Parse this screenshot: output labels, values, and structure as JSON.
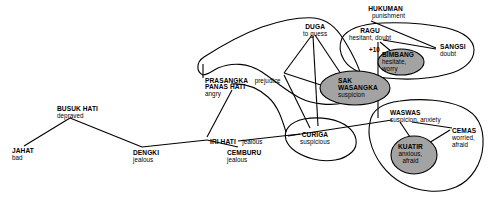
{
  "diagram": {
    "type": "semantic-network",
    "title": "",
    "colors": {
      "background": "#ffffff",
      "stroke": "#000000",
      "shaded_fill": "#a3a3a3",
      "text": "#000000"
    },
    "nodes": [
      {
        "id": "jahat",
        "term": "JAHAT",
        "gloss": "bad",
        "layout": "stacked",
        "shaded": false,
        "x": 12,
        "y": 148
      },
      {
        "id": "busuk_hati",
        "term": "BUSUK HATI",
        "gloss": "depraved",
        "layout": "stacked",
        "shaded": false,
        "x": 57,
        "y": 106
      },
      {
        "id": "dengki",
        "term": "DENGKI",
        "gloss": "jealous",
        "layout": "stacked",
        "shaded": false,
        "x": 133,
        "y": 150
      },
      {
        "id": "iri_hati",
        "term": "IRI HATI",
        "gloss": "jealous",
        "layout": "inline",
        "shaded": false,
        "x": 210,
        "y": 131
      },
      {
        "id": "cemburu",
        "term": "CEMBURU",
        "gloss": "jealous",
        "layout": "stacked",
        "shaded": false,
        "x": 227,
        "y": 150
      },
      {
        "id": "prasangka",
        "term": "PRASANGKA",
        "gloss": "prejudice",
        "layout": "inline",
        "shaded": false,
        "x": 205,
        "y": 70
      },
      {
        "id": "panas_hati",
        "term": "PANAS HATI",
        "gloss": "angry",
        "layout": "stacked",
        "shaded": false,
        "x": 205,
        "y": 84
      },
      {
        "id": "duga",
        "term": "DUGA",
        "gloss": "to guess",
        "layout": "stacked",
        "shaded": false,
        "x": 303,
        "y": 24
      },
      {
        "id": "curiga",
        "term": "CURIGA",
        "gloss": "suspicious",
        "layout": "stacked",
        "shaded": false,
        "x": 300,
        "y": 132
      },
      {
        "id": "sak_wasangka",
        "term": "SAK\nWASANGKA",
        "gloss": "suspicion",
        "layout": "stacked",
        "shaded": true,
        "x": 338,
        "y": 78
      },
      {
        "id": "hukuman",
        "term": "HUKUMAN",
        "gloss": "punishment",
        "layout": "stacked",
        "shaded": false,
        "x": 366,
        "y": 6
      },
      {
        "id": "ragu",
        "term": "RAGU",
        "gloss": "hesitant, doubt",
        "layout": "stacked",
        "shaded": false,
        "x": 349,
        "y": 28
      },
      {
        "id": "bimbang",
        "term": "BIMBANG",
        "gloss": "hesitate,\nworry",
        "layout": "stacked",
        "shaded": true,
        "x": 382,
        "y": 52
      },
      {
        "id": "sangsi",
        "term": "SANGSI",
        "gloss": "doubt",
        "layout": "stacked",
        "shaded": false,
        "x": 440,
        "y": 44
      },
      {
        "id": "waswas",
        "term": "WASWAS",
        "gloss": "suspicion, anxiety",
        "layout": "stacked",
        "shaded": false,
        "x": 390,
        "y": 110
      },
      {
        "id": "kuatir",
        "term": "KUATIR",
        "gloss": "anxious,\nafraid",
        "layout": "stacked",
        "shaded": true,
        "x": 398,
        "y": 144
      },
      {
        "id": "cemas",
        "term": "CEMAS",
        "gloss": "worried,\nafraid",
        "layout": "stacked",
        "shaded": false,
        "x": 452,
        "y": 128
      }
    ],
    "annotations": [
      {
        "id": "plus-ten",
        "text": "+10",
        "x": 369,
        "y": 46
      }
    ],
    "shaded_ellipses": [
      {
        "id": "sak-wasangka-ellipse",
        "cx": 355,
        "cy": 88,
        "rx": 35,
        "ry": 17
      },
      {
        "id": "bimbang-ellipse",
        "cx": 401,
        "cy": 62,
        "rx": 23,
        "ry": 13
      },
      {
        "id": "kuatir-ellipse",
        "cx": 414,
        "cy": 155,
        "rx": 23,
        "ry": 19
      }
    ],
    "edges": [
      {
        "from": "jahat",
        "to": "busuk_hati"
      },
      {
        "from": "busuk_hati",
        "to": "dengki"
      },
      {
        "from": "dengki",
        "to": "iri_hati"
      },
      {
        "from": "iri_hati",
        "to": "cemburu"
      },
      {
        "from": "iri_hati",
        "to": "panas_hati"
      },
      {
        "from": "cemburu",
        "to": "curiga"
      },
      {
        "from": "curiga",
        "to": "waswas"
      },
      {
        "from": "prasangka",
        "to": "duga"
      },
      {
        "from": "prasangka",
        "to": "sak_wasangka"
      },
      {
        "from": "prasangka",
        "to": "curiga"
      },
      {
        "from": "duga",
        "to": "sak_wasangka"
      },
      {
        "from": "duga",
        "to": "curiga"
      },
      {
        "from": "hukuman",
        "to": "sangsi"
      },
      {
        "from": "ragu",
        "to": "sangsi"
      },
      {
        "from": "ragu",
        "to": "bimbang"
      },
      {
        "from": "sak_wasangka",
        "to": "ragu"
      },
      {
        "from": "waswas",
        "to": "kuatir"
      },
      {
        "from": "waswas",
        "to": "cemas"
      },
      {
        "from": "kuatir",
        "to": "cemas"
      }
    ],
    "groups": [
      {
        "id": "prasangka-duga-group",
        "label": "prejudice-guess cluster"
      },
      {
        "id": "ragu-sangsi-group",
        "label": "doubt cluster"
      },
      {
        "id": "waswas-cemas-group",
        "label": "anxiety cluster"
      },
      {
        "id": "curiga-group",
        "label": "suspicion cluster"
      }
    ]
  }
}
